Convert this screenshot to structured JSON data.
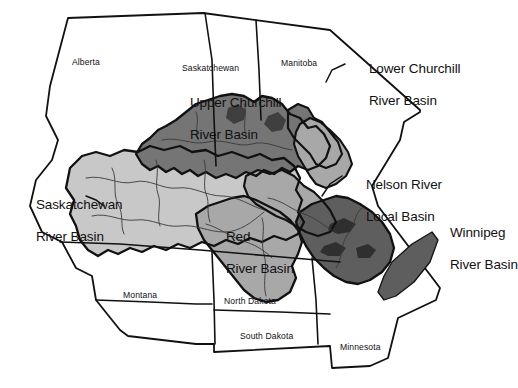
{
  "figure": {
    "kind": "map",
    "width": 493,
    "height": 388,
    "background_color": "#ffffff",
    "outline_color": "#111111"
  },
  "palette": {
    "white": "#ffffff",
    "light_gray": "#c8c8c8",
    "medium_gray": "#a8a8a8",
    "dark_gray": "#757575",
    "darker_gray": "#5e5e5e",
    "line": "#111111",
    "river": "#3a3a3a"
  },
  "basins": [
    {
      "id": "upper-churchill",
      "label_line1": "Upper Churchill",
      "label_line2": "River Basin",
      "shade": "dark_gray",
      "label_x": 168,
      "label_y": 86
    },
    {
      "id": "lower-churchill",
      "label_line1": "Lower Churchill",
      "label_line2": "River Basin",
      "shade": "medium_gray",
      "label_x": 347,
      "label_y": 50
    },
    {
      "id": "nelson-river-local",
      "label_line1": "Nelson River",
      "label_line2": "Local Basin",
      "shade": "medium_gray",
      "label_x": 344,
      "label_y": 166
    },
    {
      "id": "winnipeg-river",
      "label_line1": "Winnipeg",
      "label_line2": "River Basin",
      "shade": "darker_gray",
      "label_x": 428,
      "label_y": 214
    },
    {
      "id": "saskatchewan-river",
      "label_line1": "Saskatchewan",
      "label_line2": "River Basin",
      "shade": "light_gray",
      "label_x": 14,
      "label_y": 186
    },
    {
      "id": "red-river",
      "label_line1": "Red",
      "label_line2": "River Basin",
      "shade": "medium_gray",
      "label_x": 204,
      "label_y": 218
    }
  ],
  "regions": [
    {
      "id": "alberta",
      "label": "Alberta",
      "label_x": 72,
      "label_y": 57
    },
    {
      "id": "saskatchewan",
      "label": "Saskatchewan",
      "label_x": 182,
      "label_y": 63
    },
    {
      "id": "manitoba",
      "label": "Manitoba",
      "label_x": 281,
      "label_y": 58
    },
    {
      "id": "montana",
      "label": "Montana",
      "label_x": 123,
      "label_y": 290
    },
    {
      "id": "north-dakota",
      "label": "North Dakota",
      "label_x": 224,
      "label_y": 296
    },
    {
      "id": "south-dakota",
      "label": "South Dakota",
      "label_x": 240,
      "label_y": 331
    },
    {
      "id": "minnesota",
      "label": "Minnesota",
      "label_x": 340,
      "label_y": 342
    }
  ]
}
